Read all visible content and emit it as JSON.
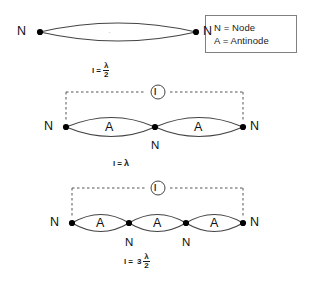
{
  "legend": {
    "title": "legend",
    "rows": [
      "N = Node",
      "A = Antinode"
    ]
  },
  "harmonics": [
    {
      "id": "fundamental",
      "loops": 1,
      "length_label": "l",
      "equation": {
        "lhs": "l",
        "eq": "=",
        "coefficient": "",
        "numerator": "λ",
        "denominator": "2",
        "plain": "l = λ/2"
      },
      "end_nodes": [
        "N",
        "N"
      ],
      "interior_nodes": [],
      "antinodes": [],
      "bracket": false
    },
    {
      "id": "second-harmonic",
      "loops": 2,
      "length_label": "l",
      "equation": {
        "lhs": "l",
        "eq": "=",
        "coefficient": "",
        "numerator": "λ",
        "denominator": "",
        "plain": "l = λ"
      },
      "end_nodes": [
        "N",
        "N"
      ],
      "interior_nodes": [
        "N"
      ],
      "antinodes": [
        "A",
        "A"
      ],
      "bracket": true
    },
    {
      "id": "third-harmonic",
      "loops": 3,
      "length_label": "l",
      "equation": {
        "lhs": "l",
        "eq": "=",
        "coefficient": "3",
        "numerator": "λ",
        "denominator": "2",
        "plain": "l = 3λ/2"
      },
      "end_nodes": [
        "N",
        "N"
      ],
      "interior_nodes": [
        "N",
        "N"
      ],
      "antinodes": [
        "A",
        "A",
        "A"
      ],
      "bracket": true
    }
  ],
  "colors": {
    "background": "#ffffff",
    "stroke": "#333333",
    "node_dot": "#000000",
    "dashed": "#555555",
    "legend_border": "#808080",
    "text": "#111111"
  }
}
